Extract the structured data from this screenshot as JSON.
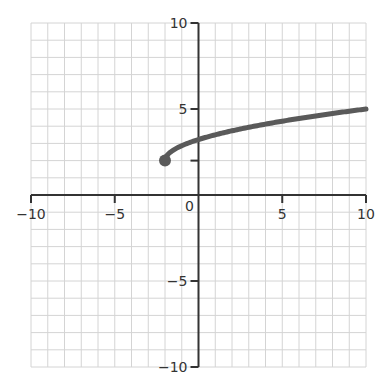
{
  "chart_data": {
    "type": "line",
    "title": "",
    "xlabel": "",
    "ylabel": "",
    "xlim": [
      -10,
      10
    ],
    "ylim": [
      -10,
      10
    ],
    "grid": true,
    "grid_step": 1,
    "x_ticks": [
      -10,
      -5,
      0,
      5,
      10
    ],
    "y_ticks": [
      10,
      5,
      -5,
      -10
    ],
    "x_tick_labels": [
      "−10",
      "−5",
      "0",
      "5",
      "10"
    ],
    "y_tick_labels": [
      "10",
      "5",
      "−5",
      "−10"
    ],
    "extra_y_tick": 2,
    "series": [
      {
        "name": "square-root curve",
        "start_point": {
          "x": -2,
          "y": 2,
          "closed": true
        },
        "end_point": {
          "x": 10,
          "y": 5
        },
        "x": [
          -2,
          -1,
          0,
          1,
          2,
          3,
          4,
          5,
          6,
          7,
          8,
          9,
          10
        ],
        "y": [
          2.0,
          2.87,
          3.22,
          3.5,
          3.73,
          3.94,
          4.12,
          4.29,
          4.45,
          4.6,
          4.74,
          4.87,
          5.0
        ]
      }
    ]
  },
  "colors": {
    "grid": "#d4d4d4",
    "axis": "#333333",
    "curve": "#5a5a5a",
    "point": "#5a5a5a",
    "text": "#333333"
  }
}
